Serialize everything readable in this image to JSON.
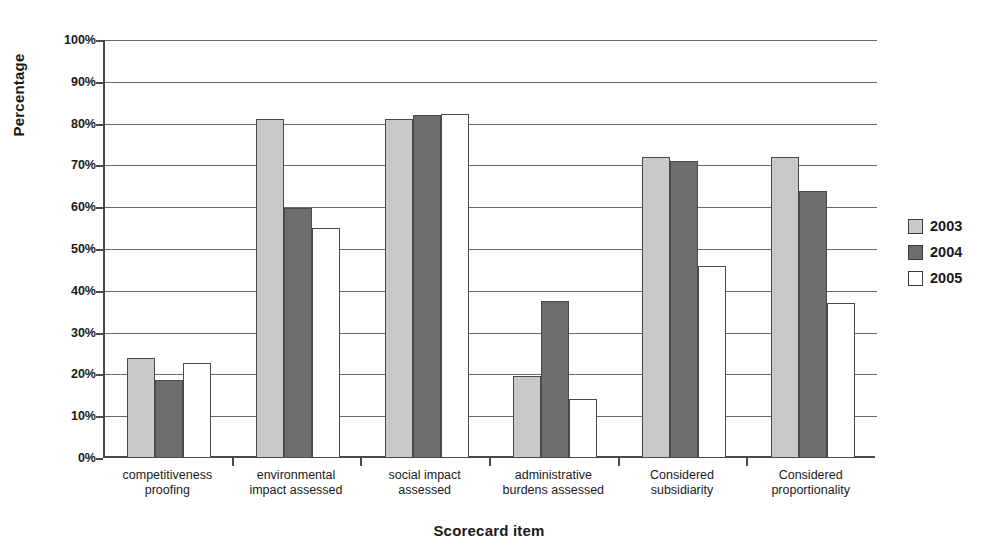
{
  "chart_data": {
    "type": "bar",
    "title": "",
    "xlabel": "Scorecard item",
    "ylabel": "Percentage",
    "ylim": [
      0,
      100
    ],
    "ytick_labels": [
      "0%",
      "10%",
      "20%",
      "30%",
      "40%",
      "50%",
      "60%",
      "70%",
      "80%",
      "90%",
      "100%"
    ],
    "ytick_values": [
      0,
      10,
      20,
      30,
      40,
      50,
      60,
      70,
      80,
      90,
      100
    ],
    "grid": true,
    "legend_position": "right",
    "categories": [
      "competitiveness\nproofing",
      "environmental\nimpact assessed",
      "social impact\nassessed",
      "administrative\nburdens assessed",
      "Considered\nsubsidiarity",
      "Considered\nproportionality"
    ],
    "series": [
      {
        "name": "2003",
        "color": "#c9c9c9",
        "values": [
          24.0,
          81.0,
          81.0,
          19.6,
          72.0,
          72.0
        ]
      },
      {
        "name": "2004",
        "color": "#6d6d6d",
        "values": [
          18.7,
          59.8,
          82.0,
          37.6,
          71.0,
          63.8
        ]
      },
      {
        "name": "2005",
        "color": "#ffffff",
        "values": [
          22.7,
          55.0,
          82.3,
          14.0,
          46.0,
          37.0
        ]
      }
    ]
  },
  "legend": {
    "items": [
      {
        "label": "2003"
      },
      {
        "label": "2004"
      },
      {
        "label": "2005"
      }
    ]
  },
  "axes": {
    "y_title": "Percentage",
    "x_title": "Scorecard item"
  }
}
